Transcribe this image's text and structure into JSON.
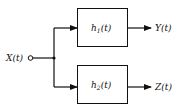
{
  "diagram": {
    "input": {
      "label": "X(t)"
    },
    "blocks": [
      {
        "name": "h",
        "subscript": "1",
        "arg": "(t)",
        "output": "Y(t)"
      },
      {
        "name": "h",
        "subscript": "2",
        "arg": "(t)",
        "output": "Z(t)"
      }
    ],
    "colors": {
      "stroke": "#111111",
      "background": "#ffffff"
    }
  }
}
